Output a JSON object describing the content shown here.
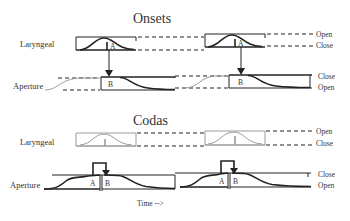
{
  "diagram": {
    "sections": [
      {
        "title": "Onsets",
        "rows": [
          {
            "label": "Laryngeal",
            "right_labels": [
              "Open",
              "Close"
            ]
          },
          {
            "label": "Aperture",
            "right_labels": [
              "Close",
              "Open"
            ]
          }
        ],
        "markers": [
          "A",
          "B"
        ]
      },
      {
        "title": "Codas",
        "rows": [
          {
            "label": "Laryngeal",
            "right_labels": [
              "Open",
              "Close"
            ]
          },
          {
            "label": "Aperture",
            "right_labels": [
              "Close",
              "Open"
            ]
          }
        ],
        "markers": [
          "A",
          "B"
        ]
      }
    ],
    "time_axis_label": "Time -->"
  },
  "colors": {
    "line": "#222222",
    "faded": "#9a9a9a",
    "text": "#333333",
    "background": "#ffffff"
  }
}
